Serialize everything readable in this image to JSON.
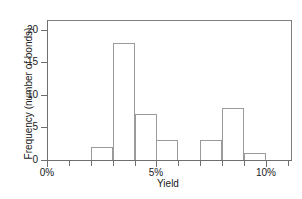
{
  "chart_data": {
    "type": "bar",
    "title": "",
    "subtitle": "",
    "xlabel": "Yield",
    "ylabel": "Frequency (number of bonds)",
    "categories": [
      "2%-3%",
      "3%-4%",
      "4%-5%",
      "5%-6%",
      "6%-7%",
      "7%-8%",
      "8%-9%",
      "9%-10%"
    ],
    "bin_edges": [
      2,
      3,
      4,
      5,
      6,
      7,
      8,
      9,
      10
    ],
    "values": [
      2,
      18,
      7,
      3,
      0,
      3,
      8,
      1
    ],
    "bin_width": 1,
    "xlim": [
      0,
      11.2
    ],
    "ylim": [
      0,
      21.5
    ],
    "xunit": "%",
    "grid": false,
    "legend": null,
    "bar_style": {
      "fill": "none",
      "edge_color": "#9a9a9a"
    },
    "axis_color": "#6f6f6f",
    "yticks": [
      {
        "value": 0,
        "label": "0"
      },
      {
        "value": 5,
        "label": "5"
      },
      {
        "value": 10,
        "label": "10"
      },
      {
        "value": 15,
        "label": "15"
      },
      {
        "value": 20,
        "label": "20"
      }
    ],
    "xticks": [
      {
        "value": 0,
        "label": "0%",
        "major": true
      },
      {
        "value": 1,
        "label": "",
        "major": false
      },
      {
        "value": 2,
        "label": "",
        "major": false
      },
      {
        "value": 3,
        "label": "",
        "major": false
      },
      {
        "value": 4,
        "label": "",
        "major": false
      },
      {
        "value": 5,
        "label": "5%",
        "major": true
      },
      {
        "value": 6,
        "label": "",
        "major": false
      },
      {
        "value": 7,
        "label": "",
        "major": false
      },
      {
        "value": 8,
        "label": "",
        "major": false
      },
      {
        "value": 9,
        "label": "",
        "major": false
      },
      {
        "value": 10,
        "label": "10%",
        "major": true
      },
      {
        "value": 11,
        "label": "",
        "major": false
      }
    ]
  }
}
